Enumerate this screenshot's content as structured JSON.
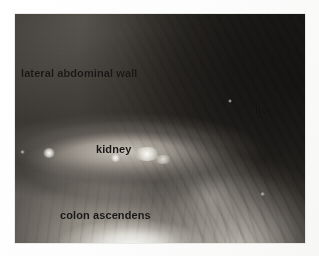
{
  "figure": {
    "type": "laparoscopic-photograph",
    "modality": "endoscopy",
    "caption": "",
    "photo": {
      "x": 15,
      "y": 14,
      "width": 290,
      "height": 229,
      "background_color": "#2b2a28",
      "page_color": "#fefefe"
    },
    "annotations": [
      {
        "id": "lateral-abdominal-wall",
        "label": "lateral abdominal wall",
        "color": "#181715"
      },
      {
        "id": "kidney",
        "label": "kidney",
        "color": "#181715"
      },
      {
        "id": "liver",
        "label": "liver",
        "color": "#121110"
      },
      {
        "id": "colon-ascendens",
        "label": "colon ascendens",
        "color": "#181715"
      }
    ]
  }
}
